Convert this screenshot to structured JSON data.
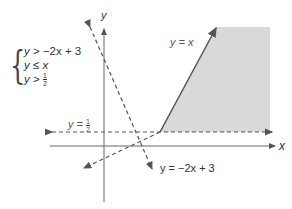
{
  "system": {
    "inequalities": [
      {
        "lhs": "y",
        "op": ">",
        "rhs": "−2x + 3"
      },
      {
        "lhs": "y",
        "op": "≤",
        "rhs": "x"
      },
      {
        "lhs": "y",
        "op": ">",
        "rhs_num": "1",
        "rhs_den": "2"
      }
    ]
  },
  "axes": {
    "x_label": "x",
    "y_label": "y"
  },
  "lines": {
    "y_eq_x": {
      "label": "y = x",
      "style": "solid-above, dashed-below"
    },
    "y_eq_neg2x_plus3": {
      "label": "y = −2x + 3",
      "style": "dashed"
    },
    "y_eq_half": {
      "label_prefix": "y = ",
      "num": "1",
      "den": "2",
      "style": "dashed"
    }
  },
  "colors": {
    "shade": "#d9d9d9",
    "line": "#555555",
    "axis": "#666666"
  }
}
